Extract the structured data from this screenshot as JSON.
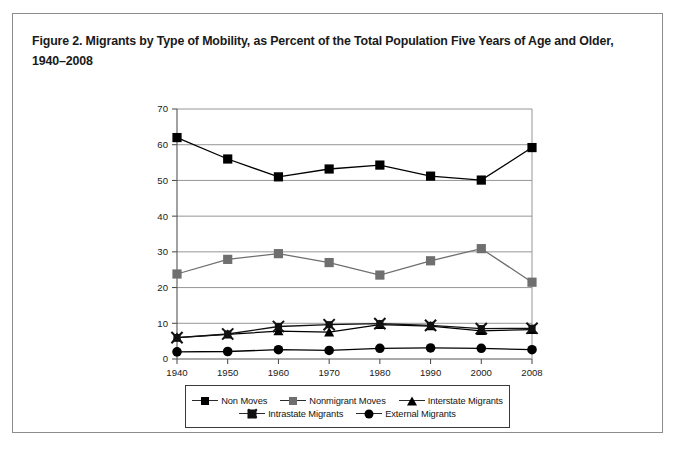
{
  "figure": {
    "title": "Figure 2. Migrants by Type of Mobility, as Percent of the Total Population Five Years of Age and Older, 1940–2008"
  },
  "chart_data": {
    "type": "line",
    "title": "Figure 2. Migrants by Type of Mobility, as Percent of the Total Population Five Years of Age and Older, 1940–2008",
    "xlabel": "",
    "ylabel": "",
    "categories": [
      "1940",
      "1950",
      "1960",
      "1970",
      "1980",
      "1990",
      "2000",
      "2008"
    ],
    "x_tick_labels": [
      "1940",
      "1950",
      "1960",
      "1970",
      "1980",
      "1990",
      "2000",
      "2008"
    ],
    "y_tick_labels": [
      "0",
      "10",
      "20",
      "30",
      "40",
      "50",
      "60",
      "70"
    ],
    "ylim": [
      0,
      70
    ],
    "y_tick_step": 10,
    "grid": "horizontal",
    "legend_position": "bottom",
    "series": [
      {
        "name": "Non Moves",
        "marker": "square",
        "color": "#000000",
        "values": [
          62,
          56,
          51,
          53.2,
          54.3,
          51.2,
          50.1,
          59.2
        ]
      },
      {
        "name": "Nonmigrant Moves",
        "marker": "square",
        "color": "#6f6f6f",
        "values": [
          23.8,
          27.9,
          29.5,
          27,
          23.5,
          27.5,
          30.9,
          21.5
        ]
      },
      {
        "name": "Interstate Migrants",
        "marker": "triangle",
        "color": "#000000",
        "values": [
          6,
          6.9,
          7.8,
          7.5,
          9.6,
          9.2,
          7.9,
          8.2
        ]
      },
      {
        "name": "Intrastate Migrants",
        "marker": "x-square",
        "color": "#111111",
        "values": [
          6,
          7,
          9.1,
          9.6,
          9.9,
          9.4,
          8.5,
          8.6
        ]
      },
      {
        "name": "External Migrants",
        "marker": "circle",
        "color": "#000000",
        "values": [
          2,
          2.1,
          2.6,
          2.4,
          3,
          3.1,
          3,
          2.6
        ]
      }
    ]
  }
}
